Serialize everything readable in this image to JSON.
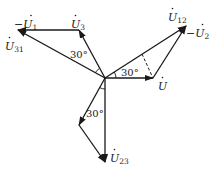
{
  "diagram": {
    "type": "phasor-diagram",
    "origin": {
      "x": 105,
      "y": 78
    },
    "vectors": [
      {
        "id": "U",
        "label": "U",
        "sub": "",
        "dot": true,
        "neg": false,
        "from": [
          105,
          78
        ],
        "to": [
          153,
          78
        ]
      },
      {
        "id": "U12",
        "label": "U",
        "sub": "12",
        "dot": true,
        "neg": false,
        "from": [
          105,
          78
        ],
        "to": [
          186,
          26
        ]
      },
      {
        "id": "U3",
        "label": "U",
        "sub": "3",
        "dot": true,
        "neg": false,
        "from": [
          105,
          78
        ],
        "to": [
          79,
          30
        ]
      },
      {
        "id": "U31",
        "label": "U",
        "sub": "31",
        "dot": true,
        "neg": false,
        "from": [
          105,
          78
        ],
        "to": [
          18,
          30
        ]
      },
      {
        "id": "negU1",
        "label": "U",
        "sub": "1",
        "dot": true,
        "neg": true,
        "from": [
          79,
          30
        ],
        "to": [
          18,
          30
        ]
      },
      {
        "id": "negU2",
        "label": "U",
        "sub": "2",
        "dot": true,
        "neg": true,
        "from": [
          153,
          78
        ],
        "to": [
          186,
          26
        ]
      },
      {
        "id": "seg23a",
        "label": "",
        "from": [
          105,
          78
        ],
        "to": [
          79,
          125
        ]
      },
      {
        "id": "U23",
        "label": "U",
        "sub": "23",
        "dot": true,
        "neg": false,
        "from": [
          79,
          125
        ],
        "to": [
          105,
          162
        ]
      },
      {
        "id": "U23main",
        "label": "",
        "from": [
          105,
          78
        ],
        "to": [
          105,
          162
        ]
      }
    ],
    "labels": {
      "negU1": {
        "text": "−U",
        "sub": "1"
      },
      "U3": {
        "text": "U",
        "sub": "3"
      },
      "U31": {
        "text": "U",
        "sub": "31"
      },
      "U12": {
        "text": "U",
        "sub": "12"
      },
      "negU2": {
        "text": "−U",
        "sub": "2"
      },
      "U": {
        "text": "U",
        "sub": ""
      },
      "U23": {
        "text": "U",
        "sub": "23"
      }
    },
    "angles": [
      {
        "text": "30°",
        "between": [
          "U3",
          "U31"
        ]
      },
      {
        "text": "30°",
        "between": [
          "U",
          "U12"
        ]
      },
      {
        "text": "30°",
        "between": [
          "U23",
          "seg23a"
        ]
      }
    ],
    "dashed_line": {
      "from": [
        142,
        54
      ],
      "to": [
        153,
        78
      ]
    }
  }
}
